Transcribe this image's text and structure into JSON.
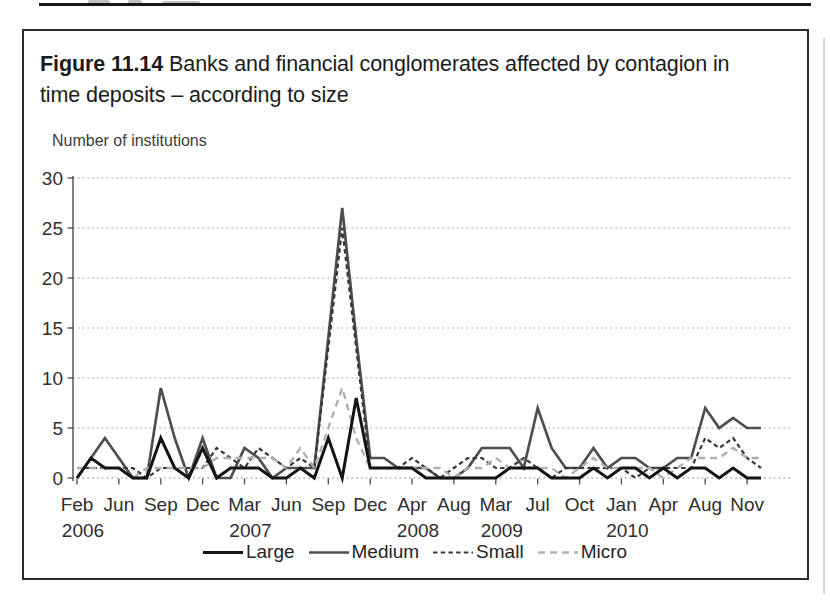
{
  "figure": {
    "label": "Figure 11.14",
    "title": "Banks and financial conglomerates affected by contagion in time deposits – according to size",
    "axis_note": "Number of institutions"
  },
  "colors": {
    "border": "#2b2b2b",
    "grid": "#9a9a9a",
    "baseline": "#828282",
    "axis": "#4a4a4a",
    "text": "#2e2e2e",
    "page_rule": "#161616",
    "page_edge": "#d4d4d4"
  },
  "chart_data": {
    "type": "line",
    "title": "Banks and financial conglomerates affected by contagion in time deposits – according to size",
    "xlabel": "",
    "ylabel": "Number of institutions",
    "ylim": [
      0,
      30
    ],
    "y_ticks": [
      0,
      5,
      10,
      15,
      20,
      25,
      30
    ],
    "grid": "horizontal dotted",
    "legend_position": "bottom-center",
    "x_tick_labels": [
      "Feb",
      "Jun",
      "Sep",
      "Dec",
      "Mar",
      "Jun",
      "Sep",
      "Dec",
      "Apr",
      "Aug",
      "Mar",
      "Jul",
      "Oct",
      "Jan",
      "Apr",
      "Aug",
      "Nov"
    ],
    "x_tick_data_indices": [
      0,
      3,
      6,
      9,
      12,
      15,
      18,
      21,
      24,
      27,
      30,
      33,
      36,
      39,
      42,
      45,
      48
    ],
    "x_year_labels": [
      {
        "tick_index": 0,
        "label": "2006"
      },
      {
        "tick_index": 4,
        "label": "2007"
      },
      {
        "tick_index": 8,
        "label": "2008"
      },
      {
        "tick_index": 10,
        "label": "2009"
      },
      {
        "tick_index": 13,
        "label": "2010"
      }
    ],
    "series": [
      {
        "name": "Large",
        "color": "#141414",
        "dash": null,
        "width": 3.0,
        "values": [
          0,
          2,
          1,
          1,
          0,
          0,
          4,
          1,
          0,
          3,
          0,
          1,
          1,
          1,
          0,
          0,
          1,
          0,
          4,
          0,
          8,
          1,
          1,
          1,
          1,
          0,
          0,
          0,
          0,
          0,
          0,
          1,
          1,
          1,
          0,
          0,
          0,
          1,
          0,
          1,
          1,
          0,
          1,
          0,
          1,
          1,
          0,
          1,
          0,
          0
        ]
      },
      {
        "name": "Medium",
        "color": "#4e4e4e",
        "dash": null,
        "width": 2.7,
        "values": [
          0,
          2,
          4,
          2,
          0,
          0,
          9,
          4,
          0,
          4,
          0,
          0,
          3,
          2,
          0,
          1,
          1,
          1,
          14,
          27,
          14,
          2,
          2,
          1,
          1,
          1,
          0,
          0,
          1,
          3,
          3,
          3,
          1,
          7,
          3,
          1,
          1,
          3,
          1,
          2,
          2,
          1,
          1,
          2,
          2,
          7,
          5,
          6,
          5,
          5
        ]
      },
      {
        "name": "Small",
        "color": "#383838",
        "dash": "4.5 3.2",
        "width": 2.2,
        "values": [
          1,
          1,
          1,
          1,
          1,
          0,
          1,
          1,
          1,
          1,
          3,
          2,
          1,
          3,
          2,
          1,
          2,
          1,
          13,
          25,
          13,
          1,
          1,
          1,
          2,
          1,
          0,
          1,
          2,
          2,
          1,
          1,
          2,
          1,
          0,
          1,
          1,
          1,
          1,
          1,
          0,
          1,
          1,
          1,
          1,
          4,
          3,
          4,
          2,
          1
        ]
      },
      {
        "name": "Micro",
        "color": "#aeaeae",
        "dash": "7 5",
        "width": 2.3,
        "values": [
          1,
          1,
          1,
          1,
          0,
          1,
          1,
          1,
          1,
          1,
          2,
          2,
          2,
          2,
          2,
          1,
          3,
          1,
          5,
          9,
          4,
          1,
          1,
          1,
          1,
          1,
          1,
          0,
          1,
          1,
          2,
          1,
          1,
          1,
          1,
          0,
          1,
          2,
          1,
          1,
          1,
          1,
          0,
          1,
          2,
          2,
          2,
          3,
          2,
          2
        ]
      }
    ]
  }
}
